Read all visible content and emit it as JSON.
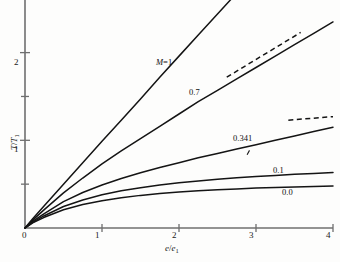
{
  "chart_data": {
    "type": "line",
    "title": "",
    "xlabel": "e/e1",
    "ylabel": "T/T1",
    "xlabel_parts": {
      "num": "e",
      "den": "e",
      "den_sub": "1"
    },
    "ylabel_parts": {
      "num": "T",
      "den": "T",
      "den_sub": "1"
    },
    "xlim": [
      0,
      4
    ],
    "ylim": [
      0,
      2.6
    ],
    "xticks": [
      0,
      1,
      2,
      3,
      4
    ],
    "xtick_labels": [
      "0",
      "1",
      "2",
      "3",
      "4"
    ],
    "yticks": [
      0.5,
      1,
      1.5,
      2
    ],
    "ytick_labels": [
      "",
      "1",
      "",
      "2"
    ],
    "ytick_major": [
      1,
      2
    ],
    "grid": false,
    "legend_position": "inline-curve-labels",
    "series": [
      {
        "name": "M=1",
        "label": "M=1",
        "label_italic_prefix": "M",
        "label_rest": "=1",
        "style": "solid",
        "x": [
          0,
          0.1,
          0.25,
          0.5,
          0.75,
          1.0,
          1.25,
          1.5,
          1.75,
          2.0,
          2.25,
          2.5,
          2.75,
          2.85
        ],
        "y": [
          0,
          0.105,
          0.255,
          0.5,
          0.745,
          0.99,
          1.23,
          1.47,
          1.72,
          1.96,
          2.2,
          2.44,
          2.68,
          2.78
        ]
      },
      {
        "name": "0.7",
        "label": "0.7",
        "style": "solid",
        "x": [
          0,
          0.1,
          0.25,
          0.5,
          0.75,
          1.0,
          1.25,
          1.5,
          1.75,
          2.0,
          2.25,
          2.5,
          2.75,
          3.0,
          3.25,
          3.5,
          3.75,
          4.0
        ],
        "y": [
          0,
          0.09,
          0.21,
          0.4,
          0.57,
          0.73,
          0.88,
          1.02,
          1.16,
          1.3,
          1.44,
          1.57,
          1.7,
          1.83,
          1.96,
          2.09,
          2.22,
          2.35
        ]
      },
      {
        "name": "0.341",
        "label": "0.341",
        "style": "solid",
        "x": [
          0,
          0.1,
          0.25,
          0.5,
          0.75,
          1.0,
          1.25,
          1.5,
          1.75,
          2.0,
          2.25,
          2.5,
          2.75,
          3.0,
          3.25,
          3.5,
          3.75,
          4.0
        ],
        "y": [
          0,
          0.075,
          0.165,
          0.3,
          0.405,
          0.49,
          0.565,
          0.63,
          0.69,
          0.745,
          0.8,
          0.85,
          0.9,
          0.95,
          1.0,
          1.05,
          1.1,
          1.15
        ]
      },
      {
        "name": "0.1",
        "label": "0.1",
        "style": "solid",
        "x": [
          0,
          0.1,
          0.25,
          0.5,
          0.75,
          1.0,
          1.25,
          1.5,
          1.75,
          2.0,
          2.25,
          2.5,
          2.75,
          3.0,
          3.25,
          3.5,
          3.75,
          4.0
        ],
        "y": [
          0,
          0.065,
          0.14,
          0.245,
          0.32,
          0.38,
          0.425,
          0.46,
          0.49,
          0.515,
          0.535,
          0.555,
          0.572,
          0.587,
          0.6,
          0.612,
          0.622,
          0.632
        ]
      },
      {
        "name": "0.0",
        "label": "0.0",
        "style": "solid",
        "x": [
          0,
          0.1,
          0.25,
          0.5,
          0.75,
          1.0,
          1.25,
          1.5,
          1.75,
          2.0,
          2.25,
          2.5,
          2.75,
          3.0,
          3.25,
          3.5,
          3.75,
          4.0
        ],
        "y": [
          0,
          0.058,
          0.122,
          0.208,
          0.268,
          0.312,
          0.345,
          0.372,
          0.393,
          0.41,
          0.424,
          0.436,
          0.446,
          0.455,
          0.462,
          0.468,
          0.473,
          0.478
        ]
      }
    ],
    "annotations": [
      {
        "name": "asymptote-upper",
        "style": "dashed",
        "x": [
          2.62,
          3.58
        ],
        "y": [
          1.72,
          2.23
        ]
      },
      {
        "name": "asymptote-lower",
        "style": "dashed",
        "x": [
          3.42,
          4.0
        ],
        "y": [
          1.23,
          1.27
        ]
      },
      {
        "name": "tick-mark-stray",
        "style": "tick",
        "x": [
          2.9
        ],
        "y": [
          0.86
        ]
      }
    ],
    "colors": {
      "curve": "#141414",
      "axis": "#6f6f6f",
      "text": "#141414",
      "background": "#fdfdfc"
    }
  }
}
